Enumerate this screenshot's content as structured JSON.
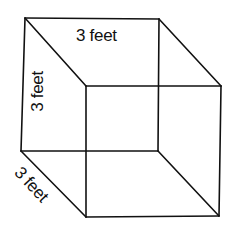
{
  "diagram": {
    "type": "cube-wireframe",
    "labels": {
      "top_edge": "3 feet",
      "left_edge": "3 feet",
      "depth_edge": "3 feet"
    },
    "vertices": {
      "back_top_left": [
        25,
        18
      ],
      "back_top_right": [
        159,
        19
      ],
      "back_bottom_left": [
        21,
        151
      ],
      "back_bottom_right": [
        158,
        151
      ],
      "front_top_left": [
        86,
        86
      ],
      "front_top_right": [
        221,
        86
      ],
      "front_bottom_left": [
        86,
        217
      ],
      "front_bottom_right": [
        219,
        216
      ]
    },
    "colors": {
      "stroke": "#111111",
      "background": "#ffffff"
    }
  }
}
